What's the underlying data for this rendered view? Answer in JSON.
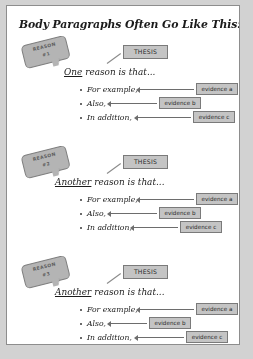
{
  "page": {
    "title": "Body Paragraphs Often Go Like This:",
    "background_color": "#d2d2d2",
    "card_color": "#ffffff",
    "accent_gray": "#c4c4c4",
    "border_gray": "#7a7a7a"
  },
  "sections": [
    {
      "reason_label_line1": "REASON",
      "reason_label_line2": "#1",
      "thesis_label": "THESIS",
      "claim_underlined": "One",
      "claim_rest": " reason is that...",
      "bullets": [
        {
          "label": "For example,",
          "evidence": "evidence a"
        },
        {
          "label": "Also,",
          "evidence": "evidence b"
        },
        {
          "label": "In addition,",
          "evidence": "evidence c"
        }
      ]
    },
    {
      "reason_label_line1": "REASON",
      "reason_label_line2": "#2",
      "thesis_label": "THESIS",
      "claim_underlined": "Another",
      "claim_rest": " reason is that...",
      "bullets": [
        {
          "label": "For example,",
          "evidence": "evidence a"
        },
        {
          "label": "Also,",
          "evidence": "evidence b"
        },
        {
          "label": "In addition,",
          "evidence": "evidence c"
        }
      ]
    },
    {
      "reason_label_line1": "REASON",
      "reason_label_line2": "#3",
      "thesis_label": "THESIS",
      "claim_underlined": "Another",
      "claim_rest": " reason is that...",
      "bullets": [
        {
          "label": "For example,",
          "evidence": "evidence a"
        },
        {
          "label": "Also,",
          "evidence": "evidence b"
        },
        {
          "label": "In addition,",
          "evidence": "evidence c"
        }
      ]
    }
  ]
}
